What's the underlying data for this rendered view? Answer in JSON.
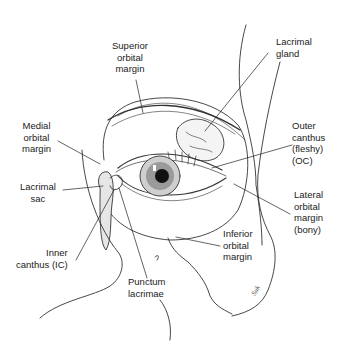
{
  "diagram": {
    "labels": [
      {
        "id": "superior-orbital-margin",
        "text": "Superior\norbital\nmargin"
      },
      {
        "id": "lacrimal-gland",
        "text": "Lacrimal\ngland"
      },
      {
        "id": "medial-orbital-margin",
        "text": "Medial\norbital\nmargin"
      },
      {
        "id": "outer-canthus",
        "text": "Outer\ncanthus\n(fleshy)\n(OC)"
      },
      {
        "id": "lacrimal-sac",
        "text": "Lacrimal\nsac"
      },
      {
        "id": "lateral-orbital-margin",
        "text": "Lateral\norbital\nmargin\n(bony)"
      },
      {
        "id": "inferior-orbital-margin",
        "text": "Inferior\norbital\nmargin"
      },
      {
        "id": "inner-canthus",
        "text": "Inner\ncanthus (IC)"
      },
      {
        "id": "punctum-lacrimae",
        "text": "Punctum\nlacrimae"
      }
    ],
    "signature": "Suk"
  }
}
